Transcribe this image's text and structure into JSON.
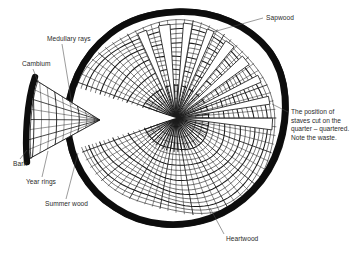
{
  "figure": {
    "background_color": "#ffffff",
    "ink_color": "#1a1a1a",
    "text_color": "#2b2b2b",
    "width": 360,
    "height": 255
  },
  "labels": {
    "sapwood": "Sapwood",
    "medullary_rays": "Medullary rays",
    "cambium": "Cambium",
    "bark": "Bark",
    "year_rings": "Year rings",
    "summer_wood": "Summer wood",
    "heartwood": "Heartwood"
  },
  "note": {
    "line1": "The position of",
    "line2": "staves cut on the",
    "line3": "quarter – quartered.",
    "line4": "Note the waste."
  },
  "caption": {
    "faint_text": ""
  },
  "diagram": {
    "pith": {
      "x": 176,
      "y": 118
    },
    "trunk_radius": 104,
    "bark_thickness": 7,
    "ring_count": 17,
    "ray_count": 72,
    "stave_count": 9,
    "detached_wedge": {
      "apex_x": 100,
      "apex_y": 120,
      "outer_x": 24,
      "outer_y": 120
    }
  }
}
